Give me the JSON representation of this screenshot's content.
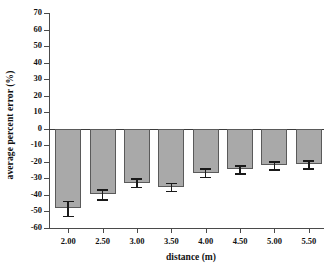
{
  "chart_data": {
    "type": "bar",
    "title": "",
    "xlabel": "distance (m)",
    "ylabel": "average percent error (%)",
    "categories": [
      "2.00",
      "2.50",
      "3.00",
      "3.50",
      "4.00",
      "4.50",
      "5.00",
      "5.50"
    ],
    "values": [
      -48.0,
      -39.5,
      -32.5,
      -35.0,
      -26.5,
      -24.5,
      -22.0,
      -21.5
    ],
    "errors": [
      4.5,
      3.0,
      2.5,
      2.5,
      2.5,
      2.5,
      2.5,
      2.5
    ],
    "ylim": [
      -60,
      70
    ],
    "yticks": [
      70,
      60,
      50,
      40,
      30,
      20,
      10,
      0,
      -10,
      -20,
      -30,
      -40,
      -50,
      -60
    ],
    "ytick_labels": [
      "70",
      "60",
      "50",
      "40",
      "30",
      "20",
      "10",
      "0",
      "-10",
      "-20",
      "-30",
      "-40",
      "-50",
      "-60"
    ],
    "grid": false,
    "legend": null,
    "bar_color": "#a9a9a9",
    "bar_edge_color": "#5a5a5a",
    "error_color": "#1a1a1a",
    "axis_color": "#4a4a4a",
    "zero_line": 0
  }
}
